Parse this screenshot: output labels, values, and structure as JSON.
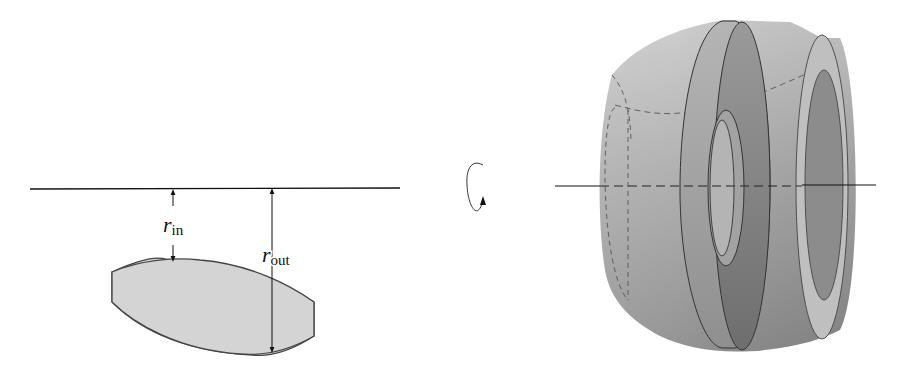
{
  "diagram": {
    "type": "solid-of-revolution-washer-method",
    "left_panel": {
      "axis": {
        "x1": 30,
        "x2": 400,
        "y": 189
      },
      "region": {
        "fill": "#d4d4d4",
        "stroke": "#444444"
      },
      "labels": {
        "r_in": {
          "main": "r",
          "sub": "in"
        },
        "r_out": {
          "main": "r",
          "sub": "out"
        }
      }
    },
    "rotation_symbol": {
      "name": "rotation-arrow",
      "direction": "counterclockwise"
    },
    "right_panel": {
      "axis": {
        "x1": 555,
        "x2": 876,
        "y": 186
      },
      "colors": {
        "body_light": "#c8c8c8",
        "body_dark": "#8a8a8a",
        "washer_face": "#7f7f7f",
        "end_face": "#bdbdbd",
        "edge": "#333333"
      }
    }
  }
}
